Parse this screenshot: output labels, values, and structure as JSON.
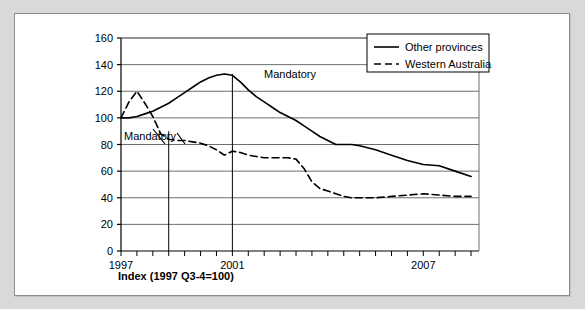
{
  "figure": {
    "frame_color": "#d9d9d9",
    "panel_color": "#ffffff",
    "border_color": "#8c8c8c"
  },
  "chart_data": {
    "type": "line",
    "title": "",
    "subtitle": "",
    "caption": "Index (1997 Q3-4=100)",
    "xlabel": "",
    "ylabel": "",
    "ylim": [
      0,
      160
    ],
    "ytick_step": 20,
    "yticks": [
      0,
      20,
      40,
      60,
      80,
      100,
      120,
      140,
      160
    ],
    "ytick_labels": [
      "0",
      "20",
      "40",
      "60",
      "80",
      "100",
      "120",
      "140",
      "160"
    ],
    "grid": "horizontal",
    "xlim": [
      1997.5,
      2008.75
    ],
    "xticks_minor_interval_years": 0.5,
    "xtick_labels": [
      "1997",
      "2001",
      "2007"
    ],
    "xtick_label_values": [
      1997.5,
      2001.0,
      2007.0
    ],
    "legend_position": "top-right",
    "line_color": "#000000",
    "series": [
      {
        "name": "Other provinces",
        "style": "solid",
        "x": [
          1997.5,
          1997.75,
          1998.0,
          1998.25,
          1998.5,
          1998.75,
          1999.0,
          1999.25,
          1999.5,
          1999.75,
          2000.0,
          2000.25,
          2000.5,
          2000.75,
          2001.0,
          2001.25,
          2001.5,
          2001.75,
          2002.0,
          2002.25,
          2002.5,
          2002.75,
          2003.0,
          2003.25,
          2003.5,
          2003.75,
          2004.0,
          2004.25,
          2004.5,
          2004.75,
          2005.0,
          2005.5,
          2006.0,
          2006.5,
          2007.0,
          2007.5,
          2008.0,
          2008.5
        ],
        "values": [
          100,
          100,
          101,
          103,
          105,
          108,
          111,
          115,
          119,
          123,
          127,
          130,
          132,
          133,
          132,
          127,
          121,
          116,
          112,
          108,
          104,
          101,
          98,
          94,
          90,
          86,
          83,
          80,
          80,
          80,
          79,
          76,
          72,
          68,
          65,
          64,
          60,
          56
        ]
      },
      {
        "name": "Western Australia",
        "style": "dashed",
        "x": [
          1997.5,
          1997.75,
          1998.0,
          1998.25,
          1998.5,
          1998.75,
          1999.0,
          1999.25,
          1999.5,
          1999.75,
          2000.0,
          2000.25,
          2000.5,
          2000.75,
          2001.0,
          2001.25,
          2001.5,
          2001.75,
          2002.0,
          2002.25,
          2002.5,
          2002.75,
          2003.0,
          2003.25,
          2003.5,
          2003.75,
          2004.0,
          2004.25,
          2004.5,
          2004.75,
          2005.0,
          2005.5,
          2006.0,
          2006.5,
          2007.0,
          2007.5,
          2008.0,
          2008.5
        ],
        "values": [
          100,
          112,
          120,
          111,
          101,
          88,
          84,
          83,
          83,
          82,
          81,
          79,
          76,
          72,
          75,
          74,
          72,
          71,
          70,
          70,
          70,
          70,
          69,
          62,
          52,
          47,
          45,
          43,
          41,
          40,
          40,
          40,
          41,
          42,
          43,
          42,
          41,
          41
        ]
      }
    ],
    "annotations": [
      {
        "label": "Mandatory",
        "x": 1999.0,
        "label_x_px": 123,
        "label_y_px": 139,
        "vline_from": 0,
        "vline_to": 90
      },
      {
        "label": "Mandatory",
        "x": 2001.0,
        "label_x_px": 263,
        "label_y_px": 77,
        "vline_from": 0,
        "vline_to": 133
      }
    ]
  }
}
